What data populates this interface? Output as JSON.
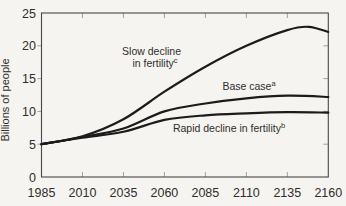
{
  "figure": {
    "background": "#f6f4f0",
    "frame_color": "#474747",
    "tick_color": "#a0a0a0",
    "curve_color": "#1b1b1b",
    "text_color": "#2e2e2e"
  },
  "chart_data": {
    "type": "line",
    "title": "",
    "xlabel": "",
    "ylabel": "Billions of people",
    "xlim": [
      1985,
      2160
    ],
    "ylim": [
      0,
      25
    ],
    "xticks": [
      1985,
      2010,
      2035,
      2060,
      2085,
      2110,
      2135,
      2160
    ],
    "yticks": [
      0,
      5,
      10,
      15,
      20,
      25
    ],
    "grid": false,
    "legend": "inline-labels",
    "x": [
      1985,
      2010,
      2035,
      2060,
      2085,
      2110,
      2135,
      2160
    ],
    "series": [
      {
        "name": "Slow decline in fertility",
        "label_lines": [
          "Slow decline",
          "in fertility"
        ],
        "label_sup": "c",
        "values": [
          5,
          6.2,
          8.8,
          13.0,
          16.8,
          20.0,
          22.4,
          22.1
        ],
        "peak": {
          "x": 2148,
          "y": 22.9
        }
      },
      {
        "name": "Base case",
        "label_lines": [
          "Base case"
        ],
        "label_sup": "a",
        "values": [
          5,
          6.1,
          7.4,
          10.0,
          11.2,
          12.0,
          12.4,
          12.2
        ]
      },
      {
        "name": "Rapid decline in fertility",
        "label_lines": [
          "Rapid decline in fertility"
        ],
        "label_sup": "b",
        "values": [
          5,
          6.0,
          6.9,
          8.7,
          9.4,
          9.7,
          9.9,
          9.8
        ]
      }
    ]
  }
}
